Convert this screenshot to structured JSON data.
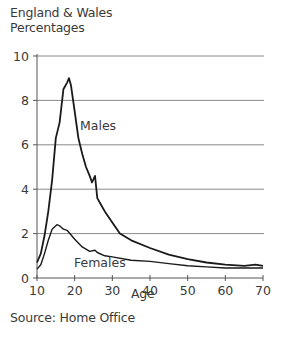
{
  "header": {
    "region": "England & Wales",
    "unit": "Percentages"
  },
  "footer": {
    "source": "Source: Home Office"
  },
  "chart_data": {
    "type": "line",
    "title": "",
    "region_label": "England & Wales",
    "ylabel": "Percentages",
    "xlabel": "Age",
    "xlim": [
      10,
      70
    ],
    "ylim": [
      0,
      10
    ],
    "xticks": [
      10,
      20,
      30,
      40,
      50,
      60,
      70
    ],
    "yticks": [
      0,
      2,
      4,
      6,
      8,
      10
    ],
    "grid": "horizontal",
    "legend": "inline labels",
    "source": "Source: Home Office",
    "series": [
      {
        "name": "Males",
        "label_pos": {
          "x": 80,
          "y": 130
        },
        "x": [
          10,
          11,
          12,
          13,
          14,
          15,
          16,
          17,
          18,
          18.5,
          19,
          20,
          21,
          22,
          23,
          24,
          24.6,
          25.4,
          26,
          27,
          28,
          30,
          32,
          35,
          40,
          45,
          50,
          55,
          60,
          65,
          68,
          70
        ],
        "values": [
          0.7,
          1.1,
          1.9,
          3.0,
          4.4,
          6.3,
          7.0,
          8.5,
          8.8,
          9.0,
          8.7,
          7.5,
          6.3,
          5.6,
          5.0,
          4.6,
          4.3,
          4.6,
          3.6,
          3.3,
          3.0,
          2.5,
          2.0,
          1.7,
          1.35,
          1.05,
          0.85,
          0.7,
          0.6,
          0.55,
          0.6,
          0.55
        ]
      },
      {
        "name": "Females",
        "label_pos": {
          "x": 74,
          "y": 267
        },
        "x": [
          10,
          11,
          12,
          13,
          14,
          15,
          15.3,
          16,
          17,
          18,
          19,
          20,
          22,
          24,
          25.4,
          26,
          28,
          30,
          35,
          40,
          45,
          50,
          55,
          60,
          65,
          70
        ],
        "values": [
          0.4,
          0.6,
          1.1,
          1.7,
          2.2,
          2.35,
          2.4,
          2.35,
          2.2,
          2.15,
          1.95,
          1.75,
          1.4,
          1.2,
          1.25,
          1.15,
          1.0,
          0.95,
          0.8,
          0.75,
          0.65,
          0.55,
          0.5,
          0.45,
          0.45,
          0.45
        ]
      }
    ]
  }
}
